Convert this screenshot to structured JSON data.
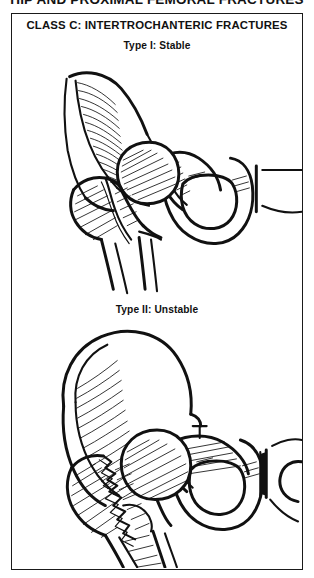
{
  "page": {
    "running_head": "HIP AND PROXIMAL FEMORAL FRACTURES",
    "ink_color": "#111111",
    "paper_color": "#ffffff"
  },
  "figure": {
    "panel_title": "CLASS C: INTERTROCHANTERIC FRACTURES",
    "border_color": "#1a1a1a",
    "subfigures": [
      {
        "label": "Type I: Stable",
        "caption_id": "type-1-stable",
        "illustration": "anteroposterior line drawing of the right hip and hemipelvis showing a stable two-part intertrochanteric fracture: the fracture line runs obliquely from the greater trochanter to the lesser trochanter with the medial cortex (calcar femorale) intact, femoral head seated in the acetabulum, iliac crest shaded with hatch lines, obturator foramen and pubic symphysis visible"
      },
      {
        "label": "Type II: Unstable",
        "caption_id": "type-2-unstable",
        "illustration": "anteroposterior line drawing of the right hip and hemipelvis showing an unstable comminuted intertrochanteric fracture: a jagged multi-fragment fracture line with loss of the posteromedial cortex and detached lesser trochanter, femoral shaft displaced medially, broad hatched iliac wing, obturator foramen and pubic symphysis visible"
      }
    ]
  }
}
